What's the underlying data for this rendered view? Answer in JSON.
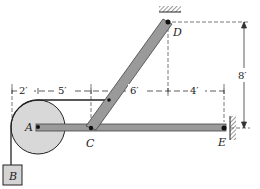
{
  "figure": {
    "type": "statics-frame-diagram",
    "points": {
      "A": "A",
      "B": "B",
      "C": "C",
      "D": "D",
      "E": "E"
    },
    "dimensions": {
      "d1": "2′",
      "d2": "5′",
      "d3": "6′",
      "d4": "4′",
      "vertical": "8′"
    },
    "colors": {
      "member_fill": "#9a9a9a",
      "member_edge": "#444444",
      "pulley_fill": "#d8d8d8",
      "block_fill": "#d4d4d4",
      "line": "#222222"
    }
  }
}
